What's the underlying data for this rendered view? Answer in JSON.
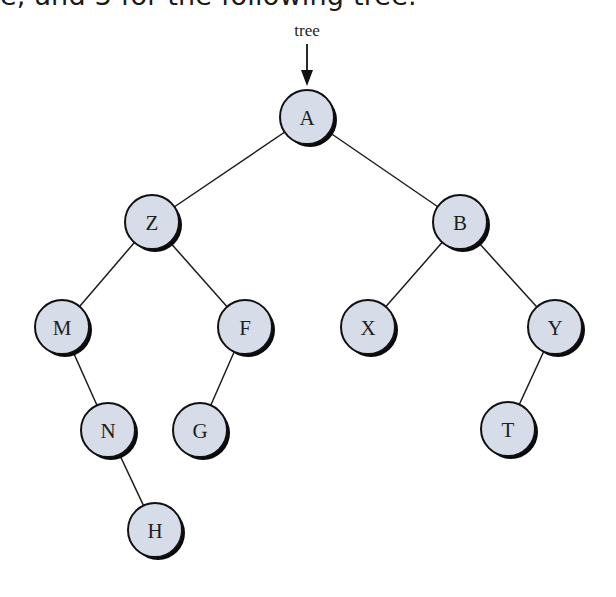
{
  "caption": {
    "clipped_text": "e, and 3 for the following tree."
  },
  "diagram": {
    "type": "binary-tree",
    "pointer": {
      "label": "tree",
      "x": 307,
      "label_y": 36,
      "line_y1": 44,
      "line_y2": 86
    },
    "node_radius": 27,
    "colors": {
      "node_fill": "#d6dde9",
      "node_stroke": "#111111",
      "edge": "#1c1c1c"
    },
    "nodes": [
      {
        "id": "A",
        "label": "A",
        "x": 307,
        "y": 117
      },
      {
        "id": "Z",
        "label": "Z",
        "x": 152,
        "y": 222
      },
      {
        "id": "B",
        "label": "B",
        "x": 460,
        "y": 222
      },
      {
        "id": "M",
        "label": "M",
        "x": 62,
        "y": 327
      },
      {
        "id": "F",
        "label": "F",
        "x": 245,
        "y": 327
      },
      {
        "id": "X",
        "label": "X",
        "x": 368,
        "y": 327
      },
      {
        "id": "Y",
        "label": "Y",
        "x": 555,
        "y": 327
      },
      {
        "id": "N",
        "label": "N",
        "x": 108,
        "y": 430
      },
      {
        "id": "G",
        "label": "G",
        "x": 200,
        "y": 430
      },
      {
        "id": "T",
        "label": "T",
        "x": 508,
        "y": 429
      },
      {
        "id": "H",
        "label": "H",
        "x": 155,
        "y": 530
      }
    ],
    "edges": [
      {
        "from": "A",
        "to": "Z"
      },
      {
        "from": "A",
        "to": "B"
      },
      {
        "from": "Z",
        "to": "M"
      },
      {
        "from": "Z",
        "to": "F"
      },
      {
        "from": "B",
        "to": "X"
      },
      {
        "from": "B",
        "to": "Y"
      },
      {
        "from": "M",
        "to": "N"
      },
      {
        "from": "N",
        "to": "H"
      },
      {
        "from": "F",
        "to": "G"
      },
      {
        "from": "Y",
        "to": "T"
      }
    ]
  }
}
